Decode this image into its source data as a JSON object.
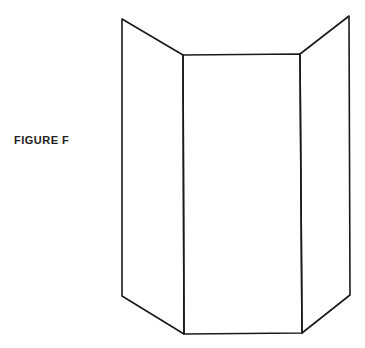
{
  "figure": {
    "label": "FIGURE F",
    "stroke_color": "#1a1a1a",
    "panels": [
      {
        "name": "left-panel",
        "points": [
          [
            122,
            19
          ],
          [
            183,
            55
          ],
          [
            184,
            334
          ],
          [
            122,
            296
          ]
        ]
      },
      {
        "name": "center-panel",
        "points": [
          [
            183,
            55
          ],
          [
            300,
            54
          ],
          [
            302,
            333
          ],
          [
            184,
            334
          ]
        ]
      },
      {
        "name": "right-panel",
        "points": [
          [
            300,
            54
          ],
          [
            349,
            16
          ],
          [
            350,
            295
          ],
          [
            302,
            333
          ]
        ]
      }
    ]
  }
}
